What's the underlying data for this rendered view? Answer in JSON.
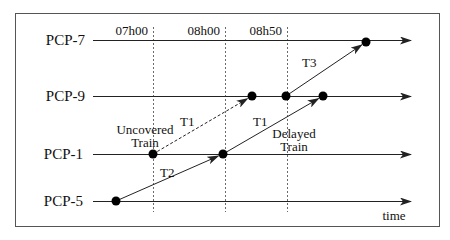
{
  "diagram": {
    "type": "time-space train diagram",
    "frame": {
      "x": 15,
      "y": 13,
      "width": 424,
      "height": 213,
      "stroke": "#555555"
    },
    "axis_label": "time",
    "stations": [
      {
        "id": "pcp7",
        "label": "PCP-7",
        "y": 40
      },
      {
        "id": "pcp9",
        "label": "PCP-9",
        "y": 96
      },
      {
        "id": "pcp1",
        "label": "PCP-1",
        "y": 154
      },
      {
        "id": "pcp5",
        "label": "PCP-5",
        "y": 201
      }
    ],
    "time_markers": [
      {
        "label": "07h00",
        "x": 153
      },
      {
        "label": "08h00",
        "x": 225
      },
      {
        "label": "08h50",
        "x": 287
      }
    ],
    "events": [
      {
        "id": "e1",
        "station": "PCP-5",
        "x": 116,
        "y": 201
      },
      {
        "id": "e2",
        "station": "PCP-1",
        "x": 153,
        "y": 154
      },
      {
        "id": "e3",
        "station": "PCP-1",
        "x": 223,
        "y": 154
      },
      {
        "id": "e4",
        "station": "PCP-9",
        "x": 252,
        "y": 96
      },
      {
        "id": "e5",
        "station": "PCP-9",
        "x": 286,
        "y": 96
      },
      {
        "id": "e6",
        "station": "PCP-9",
        "x": 323,
        "y": 96
      },
      {
        "id": "e7",
        "station": "PCP-7",
        "x": 366,
        "y": 42
      }
    ],
    "trains": [
      {
        "label": "T2",
        "from": "e1",
        "to": "e3",
        "style": "solid",
        "label_x": 160,
        "label_y": 177
      },
      {
        "label": "T1",
        "from": "e2",
        "to": "e4",
        "style": "dashed",
        "label_x": 186,
        "label_y": 126
      },
      {
        "label": "T1",
        "from": "e3",
        "to": "e6",
        "style": "solid",
        "label_x": 258,
        "label_y": 126
      },
      {
        "label": "T3",
        "from": "e5",
        "to": "e7",
        "style": "solid",
        "label_x": 302,
        "label_y": 67
      }
    ],
    "annotations": [
      {
        "id": "uncovered",
        "lines": [
          "Uncovered",
          "Train"
        ],
        "x": 145,
        "y": 131
      },
      {
        "id": "delayed",
        "lines": [
          "Delayed",
          "Train"
        ],
        "x": 294,
        "y": 137
      }
    ],
    "colors": {
      "line": "#222222",
      "dash": "#444444",
      "dot": "#000000"
    }
  }
}
